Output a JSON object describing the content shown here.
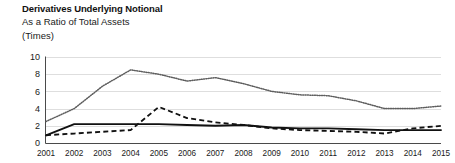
{
  "header": {
    "title": "Derivatives Underlying Notional",
    "subtitle": "As a Ratio of Total Assets",
    "units": "(Times)"
  },
  "chart_data": {
    "type": "line",
    "title": "Derivatives Underlying Notional",
    "subtitle": "As a Ratio of Total Assets",
    "xlabel": "",
    "ylabel": "(Times)",
    "ylim": [
      0,
      10
    ],
    "yticks": [
      0,
      2,
      4,
      6,
      8,
      10
    ],
    "grid": true,
    "legend": "none",
    "categories": [
      "2001",
      "2002",
      "2003",
      "2004",
      "2005",
      "2006",
      "2007",
      "2008",
      "2009",
      "2010",
      "2011",
      "2012",
      "2013",
      "2014",
      "2015"
    ],
    "series": [
      {
        "name": "dotted-series",
        "style": "dotted",
        "color": "#5e5e5e",
        "values": [
          2.5,
          4.0,
          6.6,
          8.5,
          8.0,
          7.2,
          7.6,
          6.9,
          6.0,
          5.6,
          5.5,
          4.9,
          4.0,
          4.0,
          4.3
        ]
      },
      {
        "name": "dashed-series",
        "style": "dashed",
        "color": "#111111",
        "values": [
          0.9,
          1.1,
          1.3,
          1.5,
          4.2,
          2.9,
          2.4,
          2.1,
          1.7,
          1.5,
          1.4,
          1.3,
          1.1,
          1.7,
          2.0
        ]
      },
      {
        "name": "solid-series",
        "style": "solid",
        "color": "#111111",
        "values": [
          0.9,
          2.2,
          2.2,
          2.2,
          2.2,
          2.1,
          2.0,
          2.1,
          1.8,
          1.7,
          1.7,
          1.6,
          1.5,
          1.5,
          1.5
        ]
      }
    ]
  }
}
